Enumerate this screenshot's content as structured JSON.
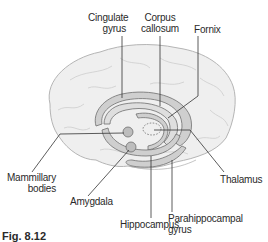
{
  "labels": {
    "cingulate_gyrus": [
      "Cingulate",
      "gyrus"
    ],
    "corpus_callosum": [
      "Corpus",
      "callosum"
    ],
    "fornix": "Fornix",
    "mammillary_bodies": [
      "Mammillary",
      "bodies"
    ],
    "amygdala": "Amygdala",
    "thalamus": "Thalamus",
    "hippocampus": "Hippocampus",
    "parahippocampal_gyrus": [
      "Parahippocampal",
      "gyrus"
    ]
  },
  "caption": {
    "figure_number": "Fig. 8.12"
  },
  "colors": {
    "brain_fill": "#efefef",
    "brain_stroke": "#b5b5b5",
    "limbic_fill": "#cfcfcf",
    "limbic_stroke": "#6f6f6f",
    "leader_line": "#333333"
  }
}
